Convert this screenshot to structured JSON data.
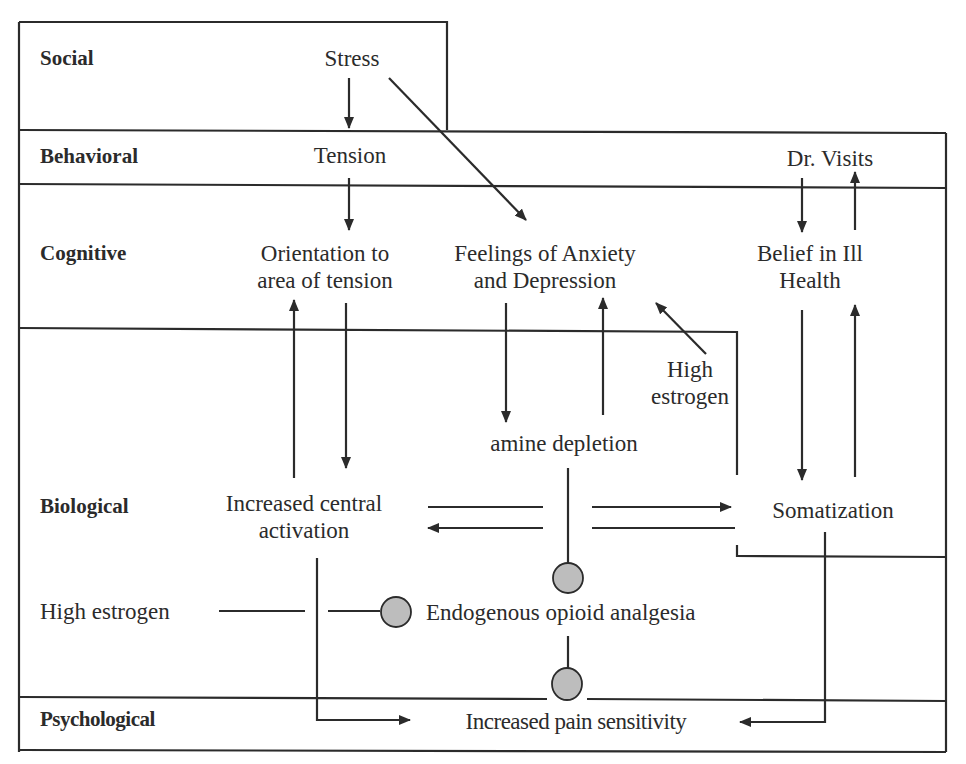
{
  "bands": {
    "social": "Social",
    "behavioral": "Behavioral",
    "cognitive": "Cognitive",
    "biological": "Biological",
    "psychological": "Psychological"
  },
  "nodes": {
    "stress": "Stress",
    "tension": "Tension",
    "dr_visits": "Dr. Visits",
    "orientation": [
      "Orientation to",
      "area of tension"
    ],
    "anxiety": [
      "Feelings of Anxiety",
      "and Depression"
    ],
    "belief": [
      "Belief in Ill",
      "Health"
    ],
    "high_estrogen_upper": [
      "High",
      "estrogen"
    ],
    "amine_depletion": "amine depletion",
    "central_activation": [
      "Increased central",
      "activation"
    ],
    "somatization": "Somatization",
    "high_estrogen_lower": "High estrogen",
    "opioid": "Endogenous opioid analgesia",
    "pain_sensitivity": "Increased pain sensitivity"
  },
  "edges": [
    {
      "from": "Stress",
      "to": "Tension",
      "type": "arrow"
    },
    {
      "from": "Stress",
      "to": "Feelings of Anxiety and Depression",
      "type": "arrow"
    },
    {
      "from": "Tension",
      "to": "Orientation to area of tension",
      "type": "arrow"
    },
    {
      "from": "Orientation to area of tension",
      "to": "Increased central activation",
      "type": "arrow"
    },
    {
      "from": "Increased central activation",
      "to": "Orientation to area of tension",
      "type": "arrow"
    },
    {
      "from": "Feelings of Anxiety and Depression",
      "to": "amine depletion",
      "type": "arrow"
    },
    {
      "from": "amine depletion",
      "to": "Feelings of Anxiety and Depression",
      "type": "arrow"
    },
    {
      "from": "High estrogen",
      "to": "Feelings of Anxiety and Depression",
      "type": "arrow"
    },
    {
      "from": "Dr. Visits",
      "to": "Belief in Ill Health",
      "type": "arrow"
    },
    {
      "from": "Belief in Ill Health",
      "to": "Dr. Visits",
      "type": "arrow"
    },
    {
      "from": "Belief in Ill Health",
      "to": "Somatization",
      "type": "arrow"
    },
    {
      "from": "Somatization",
      "to": "Belief in Ill Health",
      "type": "arrow"
    },
    {
      "from": "Increased central activation",
      "to": "Somatization",
      "type": "arrow"
    },
    {
      "from": "Somatization",
      "to": "Increased central activation",
      "type": "arrow"
    },
    {
      "from": "amine depletion",
      "to": "Endogenous opioid analgesia",
      "type": "inhibit"
    },
    {
      "from": "High estrogen",
      "to": "Endogenous opioid analgesia",
      "type": "inhibit"
    },
    {
      "from": "Endogenous opioid analgesia",
      "to": "Increased pain sensitivity",
      "type": "inhibit"
    },
    {
      "from": "Increased central activation",
      "to": "Increased pain sensitivity",
      "type": "arrow"
    },
    {
      "from": "Somatization",
      "to": "Increased pain sensitivity",
      "type": "arrow"
    }
  ],
  "colors": {
    "line": "#2b2b2b",
    "inhibitor_fill": "#bdbdbd",
    "background": "#ffffff"
  }
}
